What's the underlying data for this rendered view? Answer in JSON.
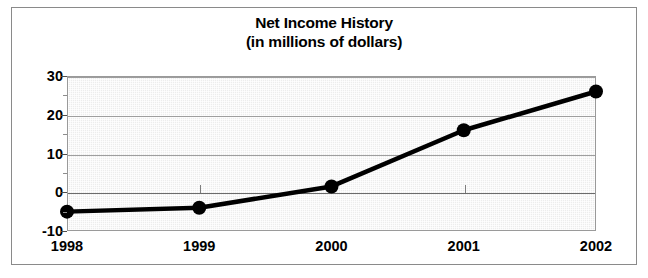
{
  "chart_data": {
    "type": "line",
    "title": "Net Income History",
    "subtitle": "(in millions of dollars)",
    "xlabel": "",
    "ylabel": "",
    "categories": [
      "1998",
      "1999",
      "2000",
      "2001",
      "2002"
    ],
    "values": [
      -5,
      -4,
      1.5,
      16,
      26
    ],
    "series": [
      {
        "name": "Net Income",
        "values": [
          -5,
          -4,
          1.5,
          16,
          26
        ]
      }
    ],
    "ylim": [
      -10,
      30
    ],
    "ytick_labels": [
      "30",
      "20",
      "10",
      "0",
      "-10"
    ],
    "ytick_values": [
      30,
      20,
      10,
      0,
      -10
    ],
    "yminor_tick_values": [
      25,
      15,
      5,
      -5
    ],
    "xtick_labels": [
      "1998",
      "1999",
      "2000",
      "2001",
      "2002"
    ],
    "grid": true,
    "legend": "none",
    "line_color": "#000000",
    "marker": "circle",
    "marker_color": "#000000",
    "plot_background": "#ededed",
    "frame_color": "#8a8a8a"
  },
  "title": {
    "line1": "Net Income History",
    "line2": "(in millions of dollars)"
  }
}
